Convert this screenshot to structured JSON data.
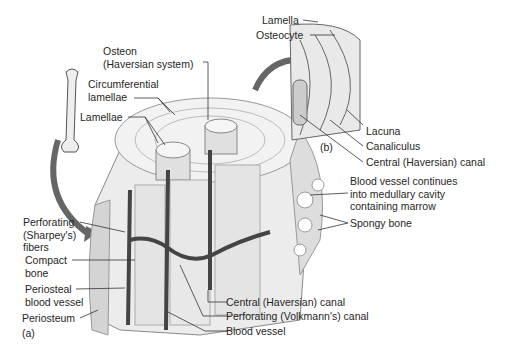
{
  "diagram": {
    "panels": {
      "a": "(a)",
      "b": "(b)"
    },
    "labels": {
      "osteon_1": "Osteon",
      "osteon_2": "(Haversian system)",
      "circ_1": "Circumferential",
      "circ_2": "lamellae",
      "lamellae": "Lamellae",
      "lamella": "Lamella",
      "osteocyte": "Osteocyte",
      "lacuna": "Lacuna",
      "canaliculus": "Canaliculus",
      "central_canal_b": "Central (Haversian) canal",
      "bv_cont_1": "Blood vessel continues",
      "bv_cont_2": "into medullary cavity",
      "bv_cont_3": "containing marrow",
      "spongy": "Spongy bone",
      "perf_fib_1": "Perforating",
      "perf_fib_2": "(Sharpey's)",
      "perf_fib_3": "fibers",
      "compact_1": "Compact",
      "compact_2": "bone",
      "periosteal_1": "Periosteal",
      "periosteal_2": "blood vessel",
      "periosteum": "Periosteum",
      "central_canal_a": "Central (Haversian) canal",
      "volkmann": "Perforating (Volkmann's) canal",
      "blood_vessel": "Blood vessel"
    }
  }
}
